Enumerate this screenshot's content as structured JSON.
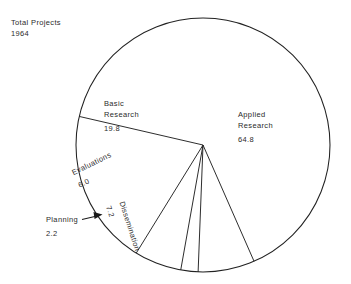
{
  "chart_data": {
    "type": "pie",
    "title": "Total Projects",
    "subtitle": "1964",
    "units": "percent",
    "categories": [
      "Applied Research",
      "Basic Research",
      "Dissemination",
      "Evaluations",
      "Planning"
    ],
    "values": [
      64.8,
      19.8,
      7.2,
      6.0,
      2.2
    ],
    "total": 100.0,
    "legend": "none",
    "grid": false,
    "slices": [
      {
        "name": "Applied Research",
        "label": "Applied Research",
        "label_line1": "Applied",
        "label_line2": "Research",
        "value": 64.8,
        "value_text": "64.8",
        "start_angle": -77,
        "end_angle": 156.3,
        "label_rotation": 0
      },
      {
        "name": "Basic Research",
        "label": "Basic Research",
        "label_line1": "Basic",
        "label_line2": "Research",
        "value": 19.8,
        "value_text": "19.8",
        "start_angle": -77,
        "end_angle": -148.3,
        "label_rotation": 0
      },
      {
        "name": "Evaluations",
        "label": "Evaluations",
        "value": 6.0,
        "value_text": "6.0",
        "start_angle": -148.3,
        "end_angle": -169.9,
        "label_rotation": -26
      },
      {
        "name": "Planning",
        "label": "Planning",
        "value": 2.2,
        "value_text": "2.2",
        "start_angle": -169.9,
        "end_angle": -177.8,
        "label_rotation": 0,
        "has_leader_arrow": true
      },
      {
        "name": "Dissemination",
        "label": "Dissemination",
        "value": 7.2,
        "value_text": "7.2",
        "start_angle": -177.8,
        "end_angle": 156.3,
        "label_rotation": 72
      }
    ],
    "style": {
      "fill": "#ffffff",
      "stroke": "#222222",
      "text": "#2b2b2b",
      "background": "#ffffff"
    },
    "geometry": {
      "center_x": 203,
      "center_y": 145,
      "radius": 127
    }
  }
}
